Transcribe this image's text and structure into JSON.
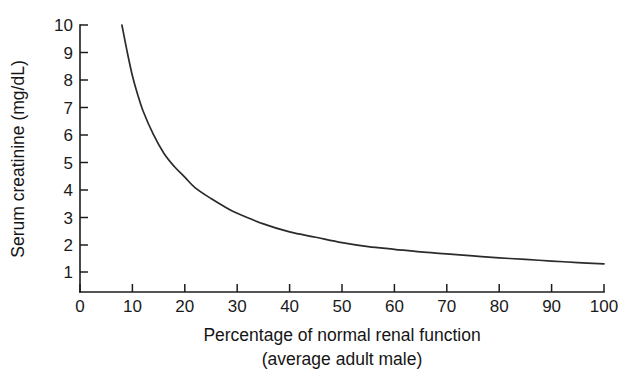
{
  "chart_data": {
    "type": "line",
    "title": "",
    "xlabel": "Percentage of normal renal function",
    "xlabel_sub": "(average adult male)",
    "ylabel": "Serum creatinine (mg/dL)",
    "xlim": [
      0,
      100
    ],
    "ylim": [
      0,
      10
    ],
    "xticks": [
      0,
      10,
      20,
      30,
      40,
      50,
      60,
      70,
      80,
      90,
      100
    ],
    "xtick_labels": [
      "0",
      "10",
      "20",
      "30",
      "40",
      "50",
      "60",
      "70",
      "80",
      "90",
      "100"
    ],
    "yticks": [
      1,
      2,
      3,
      4,
      5,
      6,
      7,
      8,
      9,
      10
    ],
    "ytick_labels": [
      "1",
      "2",
      "3",
      "4",
      "5",
      "6",
      "7",
      "8",
      "9",
      "10"
    ],
    "y_origin_label": "0",
    "grid": false,
    "legend": null,
    "series": [
      {
        "name": "Serum creatinine vs renal function",
        "color": "#2b2b2b",
        "x": [
          8,
          9,
          10,
          11,
          12,
          14,
          16,
          18,
          20,
          22,
          25,
          28,
          30,
          35,
          40,
          45,
          50,
          55,
          60,
          65,
          70,
          75,
          80,
          85,
          90,
          95,
          100
        ],
        "y": [
          10.0,
          9.0,
          8.1,
          7.4,
          6.8,
          5.9,
          5.2,
          4.7,
          4.3,
          3.9,
          3.5,
          3.15,
          2.95,
          2.55,
          2.25,
          2.05,
          1.85,
          1.7,
          1.6,
          1.5,
          1.43,
          1.35,
          1.28,
          1.22,
          1.16,
          1.1,
          1.05
        ]
      }
    ],
    "annotations": []
  }
}
